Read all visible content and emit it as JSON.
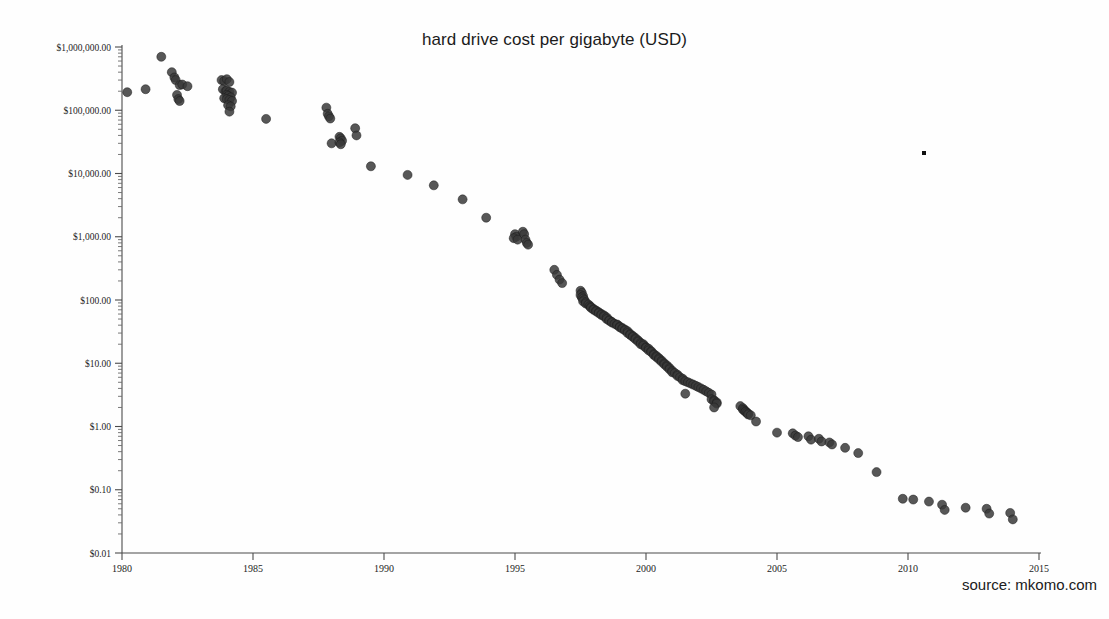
{
  "chart": {
    "title": "hard drive cost per gigabyte (USD)",
    "source_note": "source: mkomo.com"
  },
  "chart_data": {
    "type": "scatter",
    "title": "hard drive cost per gigabyte (USD)",
    "xlabel": "",
    "ylabel": "",
    "yscale": "log",
    "xlim": [
      1980,
      2015
    ],
    "ylim": [
      0.01,
      1000000
    ],
    "grid": false,
    "legend": null,
    "annotations": [
      "source: mkomo.com"
    ],
    "xticks": [
      1980,
      1985,
      1990,
      1995,
      2000,
      2005,
      2010,
      2015
    ],
    "xtick_labels": [
      "1980",
      "1985",
      "1990",
      "1995",
      "2000",
      "2005",
      "2010",
      "2015"
    ],
    "yticks": [
      0.01,
      0.1,
      1,
      10,
      100,
      1000,
      10000,
      100000,
      1000000
    ],
    "ytick_labels": [
      "$0.01",
      "$0.10",
      "$1.00",
      "$10.00",
      "$100.00",
      "$1,000.00",
      "$10,000.00",
      "$100,000.00",
      "$1,000,000.00"
    ],
    "marker": {
      "shape": "circle",
      "color": "#3a3a3a",
      "edge_color": "#1a1a1a",
      "size_px": 9,
      "opacity": 0.85
    },
    "points": [
      [
        1980.2,
        193000
      ],
      [
        1980.9,
        215000
      ],
      [
        1981.5,
        700000
      ],
      [
        1981.9,
        400000
      ],
      [
        1982.0,
        330000
      ],
      [
        1982.05,
        300000
      ],
      [
        1982.2,
        250000
      ],
      [
        1982.3,
        255000
      ],
      [
        1982.5,
        240000
      ],
      [
        1982.1,
        175000
      ],
      [
        1982.15,
        150000
      ],
      [
        1982.2,
        140000
      ],
      [
        1983.8,
        300000
      ],
      [
        1983.9,
        290000
      ],
      [
        1984.0,
        310000
      ],
      [
        1984.1,
        280000
      ],
      [
        1983.85,
        215000
      ],
      [
        1983.95,
        200000
      ],
      [
        1984.0,
        205000
      ],
      [
        1984.1,
        195000
      ],
      [
        1984.2,
        190000
      ],
      [
        1984.0,
        175000
      ],
      [
        1984.05,
        168000
      ],
      [
        1984.15,
        160000
      ],
      [
        1983.9,
        155000
      ],
      [
        1984.0,
        150000
      ],
      [
        1984.1,
        145000
      ],
      [
        1984.2,
        140000
      ],
      [
        1984.05,
        120000
      ],
      [
        1984.15,
        115000
      ],
      [
        1984.1,
        95000
      ],
      [
        1985.5,
        73000
      ],
      [
        1987.8,
        110000
      ],
      [
        1987.85,
        88000
      ],
      [
        1987.9,
        80000
      ],
      [
        1987.95,
        74000
      ],
      [
        1988.0,
        30000
      ],
      [
        1988.3,
        38000
      ],
      [
        1988.35,
        36000
      ],
      [
        1988.4,
        33000
      ],
      [
        1988.3,
        31000
      ],
      [
        1988.35,
        29000
      ],
      [
        1988.9,
        52000
      ],
      [
        1988.95,
        40000
      ],
      [
        1989.5,
        13000
      ],
      [
        1990.9,
        9500
      ],
      [
        1991.9,
        6500
      ],
      [
        1993.0,
        3900
      ],
      [
        1993.9,
        2000
      ],
      [
        1995.0,
        1100
      ],
      [
        1995.05,
        1000
      ],
      [
        1994.95,
        950
      ],
      [
        1995.1,
        900
      ],
      [
        1995.3,
        1200
      ],
      [
        1995.35,
        1100
      ],
      [
        1995.4,
        900
      ],
      [
        1995.45,
        800
      ],
      [
        1995.5,
        750
      ],
      [
        1996.5,
        300
      ],
      [
        1996.6,
        250
      ],
      [
        1996.7,
        210
      ],
      [
        1996.8,
        185
      ],
      [
        1997.5,
        140
      ],
      [
        1997.55,
        130
      ],
      [
        1997.5,
        120
      ],
      [
        1997.6,
        115
      ],
      [
        1997.55,
        110
      ],
      [
        1997.6,
        105
      ],
      [
        1997.65,
        100
      ],
      [
        1997.6,
        95
      ],
      [
        1997.7,
        92
      ],
      [
        1997.7,
        88
      ],
      [
        1997.8,
        85
      ],
      [
        1997.85,
        80
      ],
      [
        1997.9,
        78
      ],
      [
        1997.9,
        75
      ],
      [
        1998.0,
        72
      ],
      [
        1998.0,
        70
      ],
      [
        1998.1,
        68
      ],
      [
        1998.1,
        66
      ],
      [
        1998.2,
        64
      ],
      [
        1998.2,
        62
      ],
      [
        1998.3,
        60
      ],
      [
        1998.3,
        58
      ],
      [
        1998.4,
        57
      ],
      [
        1998.4,
        55
      ],
      [
        1998.5,
        53
      ],
      [
        1998.5,
        50
      ],
      [
        1998.6,
        48
      ],
      [
        1998.6,
        47
      ],
      [
        1998.7,
        45
      ],
      [
        1998.7,
        44
      ],
      [
        1998.8,
        42
      ],
      [
        1998.9,
        41
      ],
      [
        1998.9,
        40
      ],
      [
        1999.0,
        38
      ],
      [
        1999.0,
        37
      ],
      [
        1999.1,
        36
      ],
      [
        1999.1,
        35
      ],
      [
        1999.2,
        34
      ],
      [
        1999.2,
        33
      ],
      [
        1999.3,
        32
      ],
      [
        1999.3,
        30
      ],
      [
        1999.4,
        29
      ],
      [
        1999.4,
        28
      ],
      [
        1999.5,
        27
      ],
      [
        1999.5,
        26
      ],
      [
        1999.6,
        25
      ],
      [
        1999.6,
        24
      ],
      [
        1999.7,
        23
      ],
      [
        1999.7,
        22
      ],
      [
        1999.8,
        21
      ],
      [
        1999.8,
        20
      ],
      [
        1999.9,
        20
      ],
      [
        1999.9,
        19
      ],
      [
        2000.0,
        18
      ],
      [
        2000.0,
        17.5
      ],
      [
        2000.1,
        17
      ],
      [
        2000.1,
        16
      ],
      [
        2000.2,
        15.5
      ],
      [
        2000.2,
        15
      ],
      [
        2000.3,
        14
      ],
      [
        2000.3,
        13.5
      ],
      [
        2000.4,
        13
      ],
      [
        2000.4,
        12.5
      ],
      [
        2000.5,
        12
      ],
      [
        2000.5,
        11.5
      ],
      [
        2000.6,
        11
      ],
      [
        2000.6,
        10.5
      ],
      [
        2000.7,
        10
      ],
      [
        2000.7,
        9.6
      ],
      [
        2000.8,
        9.2
      ],
      [
        2000.8,
        8.8
      ],
      [
        2000.9,
        8.4
      ],
      [
        2000.9,
        8.0
      ],
      [
        2001.0,
        7.6
      ],
      [
        2001.0,
        7.2
      ],
      [
        2001.1,
        7.0
      ],
      [
        2001.2,
        6.6
      ],
      [
        2001.2,
        6.3
      ],
      [
        2001.3,
        6.0
      ],
      [
        2001.4,
        5.7
      ],
      [
        2001.4,
        5.4
      ],
      [
        2001.5,
        5.2
      ],
      [
        2001.6,
        5.0
      ],
      [
        2001.7,
        4.8
      ],
      [
        2001.8,
        4.6
      ],
      [
        2001.9,
        4.4
      ],
      [
        2002.0,
        4.2
      ],
      [
        2002.1,
        4.0
      ],
      [
        2002.2,
        3.8
      ],
      [
        2001.5,
        3.3
      ],
      [
        2002.3,
        3.6
      ],
      [
        2002.4,
        3.4
      ],
      [
        2002.5,
        3.2
      ],
      [
        2002.5,
        2.7
      ],
      [
        2002.6,
        2.6
      ],
      [
        2002.6,
        2.5
      ],
      [
        2002.7,
        2.4
      ],
      [
        2002.7,
        2.3
      ],
      [
        2002.6,
        2.0
      ],
      [
        2003.6,
        2.1
      ],
      [
        2003.7,
        1.95
      ],
      [
        2003.7,
        1.85
      ],
      [
        2003.75,
        1.8
      ],
      [
        2003.8,
        1.75
      ],
      [
        2003.8,
        1.7
      ],
      [
        2003.85,
        1.65
      ],
      [
        2003.9,
        1.6
      ],
      [
        2003.9,
        1.55
      ],
      [
        2004.0,
        1.5
      ],
      [
        2004.2,
        1.2
      ],
      [
        2005.0,
        0.8
      ],
      [
        2005.6,
        0.78
      ],
      [
        2005.7,
        0.72
      ],
      [
        2005.8,
        0.68
      ],
      [
        2006.2,
        0.7
      ],
      [
        2006.3,
        0.62
      ],
      [
        2006.6,
        0.64
      ],
      [
        2006.7,
        0.58
      ],
      [
        2007.0,
        0.56
      ],
      [
        2007.1,
        0.52
      ],
      [
        2007.6,
        0.46
      ],
      [
        2008.1,
        0.38
      ],
      [
        2008.8,
        0.19
      ],
      [
        2009.8,
        0.072
      ],
      [
        2010.2,
        0.07
      ],
      [
        2010.8,
        0.065
      ],
      [
        2011.3,
        0.058
      ],
      [
        2011.4,
        0.048
      ],
      [
        2012.2,
        0.052
      ],
      [
        2013.0,
        0.05
      ],
      [
        2013.1,
        0.042
      ],
      [
        2013.9,
        0.043
      ],
      [
        2014.0,
        0.034
      ]
    ]
  }
}
